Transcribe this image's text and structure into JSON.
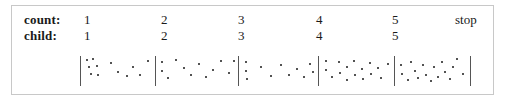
{
  "figure": {
    "caption_rows": [
      {
        "key": "count",
        "label": "count:",
        "values": [
          "1",
          "2",
          "3",
          "4",
          "5"
        ],
        "trailing": "stop"
      },
      {
        "key": "child",
        "label": "child:",
        "values": [
          "1",
          "2",
          "3",
          "4",
          "5"
        ],
        "trailing": ""
      }
    ],
    "colors": {
      "frame": "#c8c8c8",
      "separator": "#555555",
      "dot": "#1a1a1a",
      "text": "#1a1a1a",
      "background": "#ffffff"
    },
    "label_x": 24,
    "value_x": [
      84,
      161,
      238,
      316,
      392
    ],
    "stop_x": 455
  },
  "chart_data": {
    "type": "scatter",
    "title": "",
    "xlabel": "",
    "ylabel": "",
    "grid": false,
    "legend": null,
    "xlim": [
      80,
      470
    ],
    "ylim": [
      57,
      86
    ],
    "separators_x": [
      80,
      155,
      238,
      318,
      394,
      470
    ],
    "cells": [
      {
        "index": 1,
        "count_label": "1",
        "child_label": "1",
        "x_range": [
          80,
          155
        ],
        "n_dots": 12,
        "points": [
          [
            86,
            59
          ],
          [
            92,
            58
          ],
          [
            88,
            66
          ],
          [
            96,
            65
          ],
          [
            90,
            73
          ],
          [
            97,
            74
          ],
          [
            110,
            62
          ],
          [
            117,
            71
          ],
          [
            126,
            75
          ],
          [
            132,
            66
          ],
          [
            139,
            74
          ],
          [
            147,
            60
          ]
        ]
      },
      {
        "index": 2,
        "count_label": "2",
        "child_label": "2",
        "x_range": [
          155,
          238
        ],
        "n_dots": 12,
        "points": [
          [
            161,
            61
          ],
          [
            161,
            70
          ],
          [
            167,
            77
          ],
          [
            175,
            59
          ],
          [
            183,
            67
          ],
          [
            190,
            74
          ],
          [
            198,
            63
          ],
          [
            205,
            76
          ],
          [
            212,
            69
          ],
          [
            220,
            60
          ],
          [
            228,
            72
          ],
          [
            233,
            60
          ]
        ]
      },
      {
        "index": 3,
        "count_label": "3",
        "child_label": "3",
        "x_range": [
          238,
          318
        ],
        "n_dots": 11,
        "points": [
          [
            245,
            61
          ],
          [
            245,
            70
          ],
          [
            246,
            78
          ],
          [
            260,
            66
          ],
          [
            270,
            75
          ],
          [
            280,
            64
          ],
          [
            288,
            74
          ],
          [
            296,
            68
          ],
          [
            303,
            76
          ],
          [
            309,
            63
          ],
          [
            312,
            71
          ]
        ]
      },
      {
        "index": 4,
        "count_label": "4",
        "child_label": "4",
        "x_range": [
          318,
          394
        ],
        "n_dots": 16,
        "points": [
          [
            325,
            60
          ],
          [
            325,
            69
          ],
          [
            331,
            76
          ],
          [
            338,
            61
          ],
          [
            339,
            72
          ],
          [
            346,
            66
          ],
          [
            346,
            79
          ],
          [
            353,
            60
          ],
          [
            354,
            74
          ],
          [
            361,
            68
          ],
          [
            362,
            78
          ],
          [
            369,
            62
          ],
          [
            370,
            73
          ],
          [
            377,
            67
          ],
          [
            380,
            77
          ],
          [
            387,
            63
          ]
        ]
      },
      {
        "index": 5,
        "count_label": "5",
        "child_label": "5",
        "x_range": [
          394,
          470
        ],
        "n_dots": 17,
        "points": [
          [
            400,
            64
          ],
          [
            401,
            73
          ],
          [
            407,
            79
          ],
          [
            410,
            61
          ],
          [
            414,
            70
          ],
          [
            417,
            77
          ],
          [
            422,
            64
          ],
          [
            425,
            74
          ],
          [
            430,
            80
          ],
          [
            433,
            66
          ],
          [
            437,
            76
          ],
          [
            441,
            61
          ],
          [
            444,
            71
          ],
          [
            449,
            78
          ],
          [
            452,
            66
          ],
          [
            456,
            58
          ],
          [
            462,
            73
          ]
        ]
      }
    ]
  }
}
